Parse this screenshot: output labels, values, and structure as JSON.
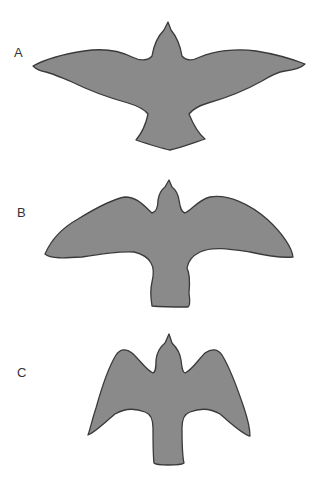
{
  "figure": {
    "panels": [
      {
        "label": "A",
        "description": "bird silhouette with long narrow pointed wings"
      },
      {
        "label": "B",
        "description": "bird silhouette with broad elliptical wings"
      },
      {
        "label": "C",
        "description": "bird silhouette with short wings swept downward"
      }
    ],
    "colors": {
      "fill": "#8a8a8a",
      "outline": "#3a3a3a"
    }
  }
}
